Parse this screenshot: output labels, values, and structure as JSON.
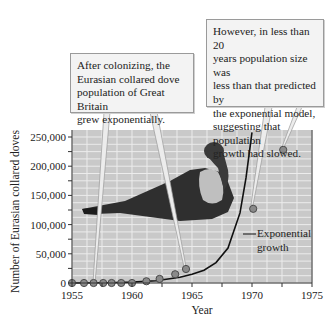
{
  "chart_data": {
    "type": "scatter",
    "title": "",
    "xlabel": "Year",
    "ylabel": "Number of Eurasian collared doves",
    "xlim": [
      1955,
      1975
    ],
    "ylim": [
      0,
      250000
    ],
    "x_ticks": [
      1955,
      1960,
      1965,
      1970,
      1975
    ],
    "x_tick_labels": [
      "1955",
      "1960",
      "1965",
      "1970",
      "1975"
    ],
    "y_ticks": [
      0,
      50000,
      100000,
      150000,
      200000,
      250000
    ],
    "y_tick_labels": [
      "0",
      "50,000",
      "100,000",
      "150,000",
      "200,000",
      "250,000"
    ],
    "grid": true,
    "series": [
      {
        "name": "Observed population",
        "kind": "points",
        "x": [
          1955,
          1956,
          1956.8,
          1957.6,
          1958.3,
          1959.1,
          1960,
          1961.2,
          1962.3,
          1963.6,
          1964.5,
          1970.1,
          1972.6
        ],
        "y": [
          0,
          0,
          0,
          0,
          0,
          0,
          0,
          3000,
          7000,
          15000,
          24000,
          127000,
          228000
        ]
      },
      {
        "name": "Exponential growth",
        "kind": "line",
        "x": [
          1955,
          1958,
          1960,
          1962,
          1964,
          1965,
          1966,
          1967,
          1968,
          1969,
          1969.5,
          1970
        ],
        "y": [
          0,
          500,
          1500,
          4000,
          10000,
          15000,
          22000,
          35000,
          60000,
          120000,
          180000,
          260000
        ]
      }
    ],
    "annotations": [
      {
        "text": "After colonizing, the Eurasian collared dove population of Great Britain grew exponentially.",
        "points_to": [
          1957,
          1964.5
        ]
      },
      {
        "text": "However, in less than 20 years population size was less than that predicted by the exponential model, suggesting that population growth had slowed.",
        "points_to": [
          1970.1,
          1972.6
        ]
      },
      {
        "text": "Exponential growth",
        "points_to": "exponential curve"
      }
    ],
    "image": "Eurasian collared dove photo inset"
  },
  "callouts": {
    "left": {
      "lines": [
        "After colonizing, the",
        "Eurasian collared dove",
        "population of Great Britain",
        "grew exponentially."
      ]
    },
    "right": {
      "lines": [
        "However, in less than 20",
        "years population size was",
        "less than that predicted by",
        "the exponential model,",
        "suggesting that population",
        "growth had slowed."
      ]
    }
  },
  "curve_label": {
    "line1": "Exponential",
    "line2": "growth"
  },
  "colors": {
    "plot_bg": "#c9c9c9",
    "grid": "#ececec",
    "point_fill": "#8a8a8a",
    "point_stroke": "#4a4a4a",
    "curve": "#111111",
    "callout_bg": "#f3f3f3"
  }
}
